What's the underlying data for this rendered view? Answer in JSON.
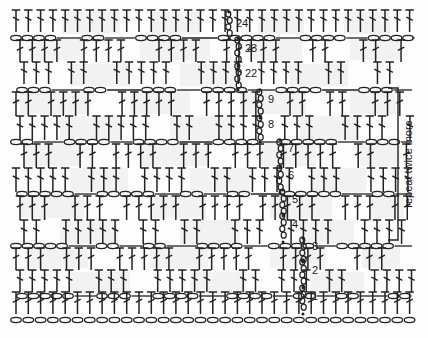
{
  "diagram": {
    "type": "crochet-stitch-diagram",
    "width": 428,
    "height": 338,
    "background_color": "#fdfdfd",
    "stroke_color": "#222222",
    "tint_color": "#f2f2f2"
  },
  "annotations": {
    "repeat_bracket_label": "repeat twice more"
  },
  "row_numbers": [
    {
      "label": "1",
      "x": 312,
      "y": 300
    },
    {
      "label": "2",
      "x": 312,
      "y": 274
    },
    {
      "label": "3",
      "x": 312,
      "y": 250
    },
    {
      "label": "4",
      "x": 292,
      "y": 228
    },
    {
      "label": "5",
      "x": 292,
      "y": 203
    },
    {
      "label": "6",
      "x": 288,
      "y": 179
    },
    {
      "label": "7",
      "x": 288,
      "y": 152
    },
    {
      "label": "8",
      "x": 268,
      "y": 128
    },
    {
      "label": "9",
      "x": 268,
      "y": 103
    },
    {
      "label": "22",
      "x": 245,
      "y": 77
    },
    {
      "label": "23",
      "x": 245,
      "y": 52
    },
    {
      "label": "24",
      "x": 236,
      "y": 27
    }
  ],
  "symbols": {
    "chain": {
      "name": "chain-stitch",
      "shape": "oval"
    },
    "double_crochet": {
      "name": "double-crochet-stitch",
      "shape": "vertical-bar-with-top-bar-and-mid-slash"
    },
    "turning_chain": {
      "name": "turning-chain-column",
      "shape": "stacked-ovals"
    }
  },
  "structure": {
    "total_rows": 24,
    "row_band_count": 12,
    "stitch_columns": 32,
    "foundation_chain_present": true,
    "foundation_chain_count": 32
  },
  "repeat_bracket": {
    "top_y": 88,
    "bottom_y": 240,
    "x": 398,
    "tick_length": 10
  },
  "chart_data": {
    "type": "diagram",
    "rows": [
      {
        "number": 1,
        "stitch": "double crochet",
        "band_y": 300
      },
      {
        "number": 2,
        "stitch": "chain / double crochet",
        "band_y": 274
      },
      {
        "number": 3,
        "stitch": "chain / double crochet",
        "band_y": 250
      },
      {
        "number": 4,
        "stitch": "chain / double crochet",
        "band_y": 228
      },
      {
        "number": 5,
        "stitch": "chain / double crochet",
        "band_y": 203
      },
      {
        "number": 6,
        "stitch": "chain / double crochet",
        "band_y": 179
      },
      {
        "number": 7,
        "stitch": "chain / double crochet",
        "band_y": 152
      },
      {
        "number": 8,
        "stitch": "chain / double crochet",
        "band_y": 128
      },
      {
        "number": 9,
        "stitch": "chain / double crochet",
        "band_y": 103
      },
      {
        "number": 22,
        "stitch": "chain / double crochet",
        "band_y": 77
      },
      {
        "number": 23,
        "stitch": "chain / double crochet",
        "band_y": 52
      },
      {
        "number": 24,
        "stitch": "double crochet",
        "band_y": 27
      }
    ],
    "legend": [
      "oval = chain stitch",
      "vertical bar with crossbar = double crochet"
    ],
    "annotations": [
      "repeat twice more"
    ]
  }
}
